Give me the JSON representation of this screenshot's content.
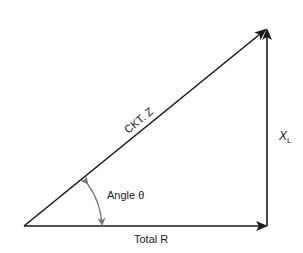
{
  "diagram": {
    "type": "impedance-triangle",
    "labels": {
      "hypotenuse": "CKT. Z",
      "base": "Total R",
      "vertical_main": "X",
      "vertical_sub": "L",
      "angle": "Angle θ"
    },
    "colors": {
      "line": "#1a1a1a",
      "arc": "#777777",
      "text": "#222222",
      "background": "#ffffff"
    }
  }
}
